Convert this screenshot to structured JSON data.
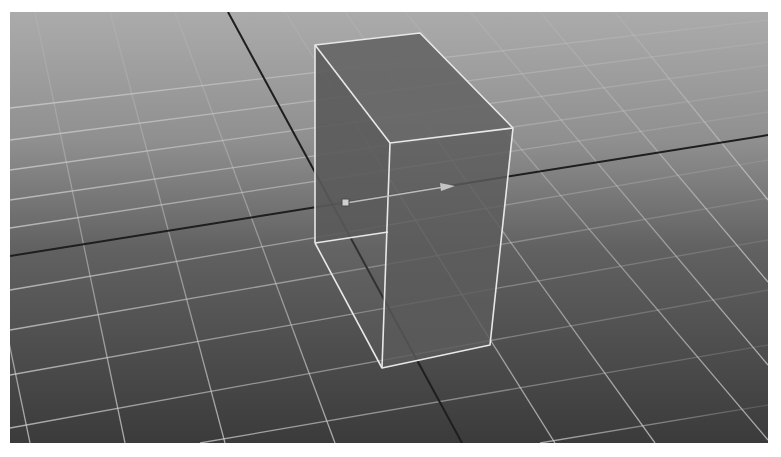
{
  "viewport": {
    "label": "3D Perspective Viewport",
    "background_top": "#a9a9a9",
    "background_bottom": "#3a3a3a",
    "grid_color": "#c8c8c8",
    "axis_color": "#1e1e1e"
  },
  "scene": {
    "object": {
      "type": "box",
      "name": "cube",
      "state": "selected",
      "wireframe_color": "#e6e6e6",
      "face_color": "#5e5e5e"
    },
    "manipulator": {
      "type": "move-tool-axis",
      "pivot_color": "#d0d0d0",
      "arrow_color": "#bdbdbd"
    }
  }
}
